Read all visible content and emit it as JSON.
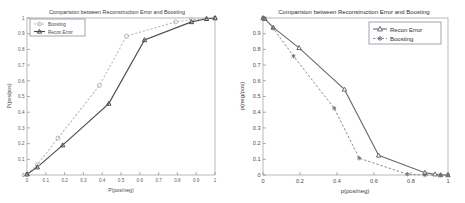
{
  "figure": {
    "background": "#ffffff",
    "panel_count": 2
  },
  "left": {
    "title": "Comparision between Reconstruction Error and Boosting",
    "xlabel": "P(pos/neg)",
    "ylabel": "P(pos/pos)",
    "xticks": [
      "0",
      "0.1",
      "0.2",
      "0.3",
      "0.4",
      "0.5",
      "0.6",
      "0.7",
      "0.8",
      "0.9",
      "1"
    ],
    "yticks": [
      "0",
      "0.1",
      "0.2",
      "0.3",
      "0.4",
      "0.5",
      "0.6",
      "0.7",
      "0.8",
      "0.9",
      "1"
    ],
    "legend": {
      "position": "top-left",
      "items": [
        {
          "label": "Boosting",
          "marker": "circle-marker",
          "line": "dashed",
          "color": "#b8b8bc"
        },
        {
          "label": "Recon Error",
          "marker": "triangle-marker",
          "line": "solid",
          "color": "#4a4a52"
        }
      ]
    }
  },
  "right": {
    "title": "Comparision between Reconstruction Error and Boosting",
    "xlabel": "p(pos/neg)",
    "ylabel": "p(neg/pos)",
    "xticks": [
      "0",
      "0.2",
      "0.4",
      "0.6",
      "0.8",
      "1"
    ],
    "yticks": [
      "0",
      "0.1",
      "0.2",
      "0.3",
      "0.4",
      "0.5",
      "0.6",
      "0.7",
      "0.8",
      "0.9"
    ],
    "legend": {
      "position": "top-right",
      "items": [
        {
          "label": "Recon Error",
          "marker": "triangle-marker",
          "line": "solid",
          "color": "#5a5a62"
        },
        {
          "label": "Boosting",
          "marker": "asterisk-marker",
          "line": "dashed",
          "color": "#6a6a72"
        }
      ]
    }
  },
  "chart_data": [
    {
      "type": "line",
      "panel": "left",
      "title": "Comparision between Reconstruction Error and Boosting",
      "xlabel": "P(pos/neg)",
      "ylabel": "P(pos/pos)",
      "xlim": [
        0,
        1
      ],
      "ylim": [
        0,
        1
      ],
      "grid": false,
      "legend_position": "top-left",
      "series": [
        {
          "name": "Boosting",
          "style": "dashed",
          "marker": "circle",
          "color": "#b8b8bc",
          "x": [
            0,
            0.055,
            0.165,
            0.385,
            0.53,
            0.79,
            0.875,
            0.955,
            1
          ],
          "y": [
            0.005,
            0.065,
            0.235,
            0.57,
            0.885,
            0.975,
            0.99,
            0.995,
            1
          ]
        },
        {
          "name": "Recon Error",
          "style": "solid",
          "marker": "triangle",
          "color": "#4a4a52",
          "x": [
            0,
            0.055,
            0.19,
            0.435,
            0.625,
            0.875,
            0.955,
            1
          ],
          "y": [
            0.005,
            0.05,
            0.19,
            0.455,
            0.86,
            0.975,
            0.995,
            1
          ]
        }
      ]
    },
    {
      "type": "line",
      "panel": "right",
      "title": "Comparision between Reconstruction Error and Boosting",
      "xlabel": "p(pos/neg)",
      "ylabel": "p(neg/pos)",
      "xlim": [
        0,
        1
      ],
      "ylim": [
        0,
        1
      ],
      "grid": false,
      "legend_position": "top-right",
      "series": [
        {
          "name": "Recon Error",
          "style": "solid",
          "marker": "triangle",
          "color": "#5a5a62",
          "x": [
            0,
            0.01,
            0.055,
            0.195,
            0.44,
            0.625,
            0.875,
            0.93,
            0.96,
            1
          ],
          "y": [
            1,
            0.995,
            0.94,
            0.81,
            0.545,
            0.125,
            0.015,
            0.005,
            0.0,
            0.0
          ]
        },
        {
          "name": "Boosting",
          "style": "dashed",
          "marker": "asterisk",
          "color": "#6a6a72",
          "x": [
            0,
            0.01,
            0.055,
            0.165,
            0.385,
            0.52,
            0.78,
            0.875,
            0.96,
            1
          ],
          "y": [
            1,
            0.995,
            0.935,
            0.757,
            0.425,
            0.107,
            0.005,
            0.0,
            0.0,
            0.0
          ]
        }
      ]
    }
  ]
}
